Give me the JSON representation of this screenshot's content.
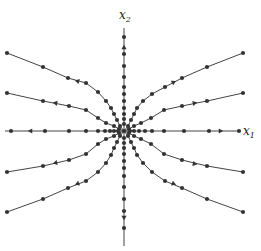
{
  "diagram": {
    "type": "phase-portrait",
    "center": [
      124,
      131
    ],
    "colors": {
      "stroke": "#444444",
      "dot": "#333333",
      "background": "#ffffff"
    },
    "axes": {
      "x": {
        "label": "x",
        "subscript": "1",
        "from": [
          5,
          131
        ],
        "to": [
          240,
          131
        ]
      },
      "y": {
        "label": "x",
        "subscript": "2",
        "from": [
          124,
          28
        ],
        "to": [
          124,
          246
        ]
      }
    },
    "trajectories": [
      {
        "name": "axis-left",
        "points": [
          [
            124,
            131
          ],
          [
            118,
            131
          ],
          [
            114,
            131
          ],
          [
            110,
            131
          ],
          [
            105,
            131
          ],
          [
            98,
            131
          ],
          [
            86,
            131
          ],
          [
            69,
            131
          ],
          [
            45,
            131
          ],
          [
            11,
            131
          ]
        ],
        "arrow": {
          "at": [
            30,
            131
          ],
          "dir": "left"
        }
      },
      {
        "name": "axis-right",
        "points": [
          [
            124,
            131
          ],
          [
            130,
            131
          ],
          [
            134,
            131
          ],
          [
            139,
            131
          ],
          [
            145,
            131
          ],
          [
            152,
            131
          ],
          [
            164,
            131
          ],
          [
            184,
            131
          ],
          [
            209,
            131
          ],
          [
            239,
            131
          ]
        ],
        "arrow": {
          "at": [
            221,
            131
          ],
          "dir": "right"
        }
      },
      {
        "name": "axis-up",
        "points": [
          [
            124,
            131
          ],
          [
            124,
            124
          ],
          [
            124,
            119
          ],
          [
            124,
            114
          ],
          [
            124,
            108
          ],
          [
            124,
            101
          ],
          [
            124,
            94
          ],
          [
            124,
            87
          ],
          [
            124,
            77
          ],
          [
            124,
            66
          ],
          [
            124,
            54
          ],
          [
            124,
            37
          ]
        ],
        "arrow": {
          "at": [
            124,
            47
          ],
          "dir": "up"
        }
      },
      {
        "name": "axis-down",
        "points": [
          [
            124,
            131
          ],
          [
            124,
            138
          ],
          [
            124,
            143
          ],
          [
            124,
            148
          ],
          [
            124,
            154
          ],
          [
            124,
            161
          ],
          [
            124,
            168
          ],
          [
            124,
            176
          ],
          [
            124,
            187
          ],
          [
            124,
            199
          ],
          [
            124,
            211
          ],
          [
            124,
            228
          ]
        ],
        "arrow": {
          "at": [
            124,
            218
          ],
          "dir": "down"
        }
      },
      {
        "name": "upper-left-outer",
        "points": [
          [
            124,
            131
          ],
          [
            120,
            126
          ],
          [
            117,
            120
          ],
          [
            114,
            114
          ],
          [
            111,
            108
          ],
          [
            106,
            101
          ],
          [
            98,
            92
          ],
          [
            86,
            83
          ],
          [
            68,
            78
          ],
          [
            43,
            67
          ],
          [
            7,
            53
          ]
        ],
        "arrow": {
          "at": [
            77,
            81
          ],
          "dir": "left"
        }
      },
      {
        "name": "upper-left-inner",
        "points": [
          [
            124,
            131
          ],
          [
            119,
            129
          ],
          [
            114,
            126
          ],
          [
            106,
            123
          ],
          [
            98,
            118
          ],
          [
            86,
            110
          ],
          [
            69,
            106
          ],
          [
            43,
            101
          ],
          [
            7,
            93
          ]
        ],
        "arrow": {
          "at": [
            55,
            103
          ],
          "dir": "left"
        }
      },
      {
        "name": "upper-right-outer",
        "points": [
          [
            124,
            131
          ],
          [
            128,
            126
          ],
          [
            131,
            120
          ],
          [
            134,
            114
          ],
          [
            137,
            108
          ],
          [
            143,
            101
          ],
          [
            152,
            94
          ],
          [
            165,
            87
          ],
          [
            182,
            78
          ],
          [
            207,
            67
          ],
          [
            243,
            53
          ]
        ],
        "arrow": {
          "at": [
            174,
            82
          ],
          "dir": "right"
        }
      },
      {
        "name": "upper-right-inner",
        "points": [
          [
            124,
            131
          ],
          [
            129,
            129
          ],
          [
            134,
            126
          ],
          [
            141,
            123
          ],
          [
            151,
            118
          ],
          [
            164,
            110
          ],
          [
            182,
            106
          ],
          [
            207,
            101
          ],
          [
            243,
            93
          ]
        ],
        "arrow": {
          "at": [
            195,
            103
          ],
          "dir": "right"
        }
      },
      {
        "name": "lower-left-inner",
        "points": [
          [
            124,
            131
          ],
          [
            119,
            133
          ],
          [
            114,
            136
          ],
          [
            106,
            139
          ],
          [
            98,
            144
          ],
          [
            86,
            154
          ],
          [
            69,
            160
          ],
          [
            43,
            166
          ],
          [
            7,
            172
          ]
        ],
        "arrow": {
          "at": [
            55,
            163
          ],
          "dir": "left"
        }
      },
      {
        "name": "lower-left-outer",
        "points": [
          [
            124,
            131
          ],
          [
            120,
            136
          ],
          [
            117,
            142
          ],
          [
            114,
            148
          ],
          [
            111,
            155
          ],
          [
            106,
            163
          ],
          [
            98,
            172
          ],
          [
            86,
            181
          ],
          [
            68,
            188
          ],
          [
            43,
            199
          ],
          [
            7,
            212
          ]
        ],
        "arrow": {
          "at": [
            77,
            184
          ],
          "dir": "left"
        }
      },
      {
        "name": "lower-right-inner",
        "points": [
          [
            124,
            131
          ],
          [
            129,
            133
          ],
          [
            134,
            136
          ],
          [
            141,
            139
          ],
          [
            151,
            144
          ],
          [
            164,
            154
          ],
          [
            182,
            160
          ],
          [
            207,
            166
          ],
          [
            243,
            172
          ]
        ],
        "arrow": {
          "at": [
            195,
            164
          ],
          "dir": "right"
        }
      },
      {
        "name": "lower-right-outer",
        "points": [
          [
            124,
            131
          ],
          [
            128,
            136
          ],
          [
            131,
            142
          ],
          [
            134,
            148
          ],
          [
            137,
            155
          ],
          [
            143,
            163
          ],
          [
            152,
            172
          ],
          [
            165,
            181
          ],
          [
            182,
            188
          ],
          [
            207,
            199
          ],
          [
            243,
            212
          ]
        ],
        "arrow": {
          "at": [
            174,
            184
          ],
          "dir": "right"
        }
      }
    ]
  }
}
